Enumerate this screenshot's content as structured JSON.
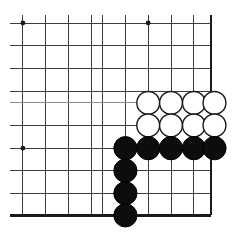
{
  "board": {
    "title": "Go board corner diagram",
    "type": "go-diagram",
    "geometry": {
      "width": 233,
      "height": 238,
      "cell_size": 22.8,
      "origin_x": 0.5,
      "origin_y": 23.0,
      "stone_radius": 11.4,
      "columns_x": [
        0.5,
        22.9,
        45.8,
        68.6,
        91.5,
        102.9,
        125.4,
        148.2,
        171.0,
        193.9,
        211.2
      ],
      "rows_y": [
        23.0,
        45.8,
        68.6,
        91.5,
        102.9,
        125.4,
        148.2,
        170.7,
        193.3,
        215.4
      ]
    },
    "colors": {
      "background": "#ffffff",
      "grid": "#3d3d3d",
      "grid_faint": "#8a8a8a",
      "edge": "#1a1a1a",
      "black_stone": "#0d0d0d",
      "white_stone_fill": "#ffffff",
      "white_stone_edge": "#1a1a1a",
      "star_point": "#1a1a1a"
    },
    "vertical_lines": [
      {
        "name": "v-1",
        "x": 22.9,
        "weight": "normal"
      },
      {
        "name": "v-2",
        "x": 45.8,
        "weight": "normal"
      },
      {
        "name": "v-3",
        "x": 68.6,
        "weight": "normal"
      },
      {
        "name": "v-4",
        "x": 91.5,
        "weight": "normal"
      },
      {
        "name": "v-5",
        "x": 102.9,
        "weight": "normal"
      },
      {
        "name": "v-6",
        "x": 125.4,
        "weight": "normal"
      },
      {
        "name": "v-7",
        "x": 148.2,
        "weight": "normal"
      },
      {
        "name": "v-8",
        "x": 171.0,
        "weight": "normal"
      },
      {
        "name": "v-9",
        "x": 193.9,
        "weight": "normal"
      }
    ],
    "horizontal_lines": [
      {
        "name": "h-1",
        "y": 23.0,
        "weight": "normal"
      },
      {
        "name": "h-2",
        "y": 45.8,
        "weight": "normal"
      },
      {
        "name": "h-3",
        "y": 68.6,
        "weight": "normal"
      },
      {
        "name": "h-4",
        "y": 91.5,
        "weight": "normal"
      },
      {
        "name": "h-5",
        "y": 102.9,
        "weight": "faint"
      },
      {
        "name": "h-6",
        "y": 125.4,
        "weight": "normal"
      },
      {
        "name": "h-7",
        "y": 148.2,
        "weight": "normal"
      },
      {
        "name": "h-8",
        "y": 170.7,
        "weight": "normal"
      },
      {
        "name": "h-9",
        "y": 193.3,
        "weight": "normal"
      }
    ],
    "edges": [
      {
        "name": "right-edge",
        "x1": 211.2,
        "y1": 15.0,
        "x2": 211.2,
        "y2": 215.4
      },
      {
        "name": "bottom-edge",
        "x1": 10.0,
        "y1": 215.4,
        "x2": 211.2,
        "y2": 215.4
      },
      {
        "name": "top-open",
        "x1": 10.0,
        "y1": 23.0,
        "x2": 211.2,
        "y2": 23.0
      }
    ],
    "star_points": [
      {
        "name": "star-point-top-left",
        "x": 22.9,
        "y": 23.0,
        "r": 2.4
      },
      {
        "name": "star-point-top-right",
        "x": 148.2,
        "y": 23.0,
        "r": 2.4
      },
      {
        "name": "star-point-left",
        "x": 22.9,
        "y": 148.2,
        "r": 2.4
      }
    ],
    "stones": [
      {
        "name": "white-stone-1",
        "color": "white",
        "x": 148.2,
        "y": 102.9,
        "r": 11.4
      },
      {
        "name": "white-stone-2",
        "color": "white",
        "x": 171.0,
        "y": 102.9,
        "r": 11.4
      },
      {
        "name": "white-stone-3",
        "color": "white",
        "x": 193.9,
        "y": 102.9,
        "r": 11.4
      },
      {
        "name": "white-stone-4",
        "color": "white",
        "x": 214.5,
        "y": 102.9,
        "r": 11.4
      },
      {
        "name": "white-stone-5",
        "color": "white",
        "x": 148.2,
        "y": 125.4,
        "r": 11.4
      },
      {
        "name": "white-stone-6",
        "color": "white",
        "x": 171.0,
        "y": 125.4,
        "r": 11.4
      },
      {
        "name": "white-stone-7",
        "color": "white",
        "x": 193.9,
        "y": 125.4,
        "r": 11.4
      },
      {
        "name": "white-stone-8",
        "color": "white",
        "x": 214.5,
        "y": 125.4,
        "r": 11.4
      },
      {
        "name": "black-stone-1",
        "color": "black",
        "x": 125.4,
        "y": 148.2,
        "r": 11.6
      },
      {
        "name": "black-stone-2",
        "color": "black",
        "x": 148.2,
        "y": 148.2,
        "r": 11.6
      },
      {
        "name": "black-stone-3",
        "color": "black",
        "x": 171.0,
        "y": 148.2,
        "r": 11.6
      },
      {
        "name": "black-stone-4",
        "color": "black",
        "x": 193.9,
        "y": 148.2,
        "r": 11.6
      },
      {
        "name": "black-stone-5",
        "color": "black",
        "x": 214.5,
        "y": 148.2,
        "r": 11.6
      },
      {
        "name": "black-stone-6",
        "color": "black",
        "x": 125.4,
        "y": 170.7,
        "r": 11.6
      },
      {
        "name": "black-stone-7",
        "color": "black",
        "x": 125.4,
        "y": 193.3,
        "r": 11.6
      },
      {
        "name": "black-stone-8",
        "color": "black",
        "x": 125.4,
        "y": 215.4,
        "r": 11.6
      }
    ],
    "counts": {
      "white_stones": 8,
      "black_stones": 8,
      "star_points": 3
    }
  }
}
